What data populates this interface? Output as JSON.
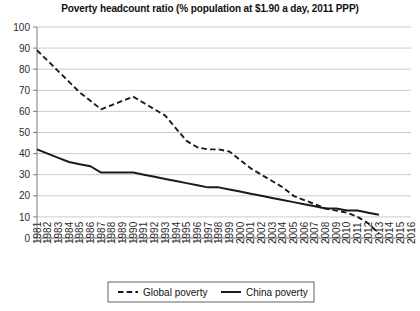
{
  "chart_data": {
    "type": "line",
    "title": "Poverty headcount ratio (% population at $1.90 a day, 2011 PPP)",
    "xlabel": "",
    "ylabel": "",
    "ylim": [
      0,
      100
    ],
    "ytick_step": 10,
    "yticks": [
      "0",
      "10",
      "20",
      "30",
      "40",
      "50",
      "60",
      "70",
      "80",
      "90",
      "100"
    ],
    "grid": true,
    "grid_axis": "y",
    "legend_position": "bottom",
    "categories": [
      "1981",
      "1982",
      "1983",
      "1984",
      "1985",
      "1986",
      "1987",
      "1988",
      "1989",
      "1990",
      "1991",
      "1992",
      "1993",
      "1994",
      "1995",
      "1996",
      "1997",
      "1998",
      "1999",
      "2000",
      "2001",
      "2002",
      "2003",
      "2004",
      "2005",
      "2006",
      "2007",
      "2008",
      "2009",
      "2010",
      "2011",
      "2012",
      "2013",
      "2014",
      "2015",
      "2016"
    ],
    "series": [
      {
        "name": "Global poverty",
        "style": "dashed",
        "color": "#1a1a1a",
        "values": [
          89,
          84,
          79,
          74,
          69,
          65,
          61,
          63,
          65,
          67,
          64,
          61,
          58,
          52,
          46,
          43,
          42,
          42,
          41,
          37,
          33,
          30,
          27,
          24,
          20,
          18,
          16,
          14,
          13,
          12,
          10,
          7,
          2,
          null,
          null,
          null
        ]
      },
      {
        "name": "China poverty",
        "style": "solid",
        "color": "#1a1a1a",
        "values": [
          42,
          40,
          38,
          36,
          35,
          34,
          31,
          31,
          31,
          31,
          30,
          29,
          28,
          27,
          26,
          25,
          24,
          24,
          23,
          22,
          21,
          20,
          19,
          18,
          17,
          16,
          15,
          14,
          14,
          13,
          13,
          12,
          11,
          null,
          null,
          null
        ]
      }
    ]
  },
  "legend": {
    "entries": [
      {
        "label": "Global poverty",
        "style": "dashed"
      },
      {
        "label": "China poverty",
        "style": "solid"
      }
    ]
  }
}
